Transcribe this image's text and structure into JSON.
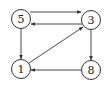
{
  "graph": {
    "type": "directed",
    "nodes": [
      {
        "id": "5",
        "label": "5",
        "x": 21,
        "y": 19
      },
      {
        "id": "3",
        "label": "3",
        "x": 91,
        "y": 20
      },
      {
        "id": "1",
        "label": "1",
        "x": 21,
        "y": 69
      },
      {
        "id": "8",
        "label": "8",
        "x": 91,
        "y": 70
      }
    ],
    "edges": [
      {
        "from": "5",
        "to": "3"
      },
      {
        "from": "3",
        "to": "5"
      },
      {
        "from": "5",
        "to": "1"
      },
      {
        "from": "1",
        "to": "3"
      },
      {
        "from": "3",
        "to": "8"
      },
      {
        "from": "8",
        "to": "1"
      }
    ],
    "colors": {
      "stroke": "#333333",
      "background": "#ffffff"
    }
  }
}
